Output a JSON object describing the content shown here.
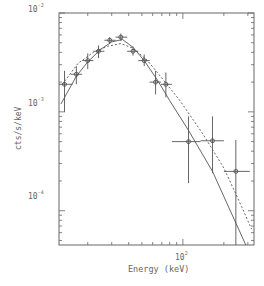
{
  "chart_data": {
    "type": "scatter",
    "title": "",
    "xlabel": "Energy (keV)",
    "ylabel": "cts/s/keV",
    "xscale": "log",
    "yscale": "log",
    "xlim": [
      12.3,
      333
    ],
    "ylim": [
      4.5e-05,
      0.01
    ],
    "x_tick_labels": [
      {
        "value": 100,
        "label": "10",
        "exp": "2"
      }
    ],
    "y_tick_labels": [
      {
        "value": 0.01,
        "label": "10",
        "exp": "-2"
      },
      {
        "value": 0.001,
        "label": "10",
        "exp": "-3"
      },
      {
        "value": 0.0001,
        "label": "10",
        "exp": "-4"
      }
    ],
    "grid": false,
    "legend": null,
    "series": [
      {
        "name": "data",
        "style": "crosses with circle markers",
        "points": [
          {
            "x": 13.5,
            "y": 0.0019,
            "xerr": [
              12.3,
              15.5
            ],
            "yerr": [
              0.001,
              0.0026
            ]
          },
          {
            "x": 16.5,
            "y": 0.0024,
            "xerr": [
              15.0,
              18.2
            ],
            "yerr": [
              0.0019,
              0.0029
            ]
          },
          {
            "x": 20.0,
            "y": 0.0033,
            "xerr": [
              18.2,
              22.0
            ],
            "yerr": [
              0.0027,
              0.0039
            ]
          },
          {
            "x": 24.0,
            "y": 0.0041,
            "xerr": [
              22.0,
              26.5
            ],
            "yerr": [
              0.0035,
              0.0047
            ]
          },
          {
            "x": 29.0,
            "y": 0.0053,
            "xerr": [
              26.5,
              32.0
            ],
            "yerr": [
              0.0049,
              0.0057
            ]
          },
          {
            "x": 35.0,
            "y": 0.0057,
            "xerr": [
              32.0,
              39.0
            ],
            "yerr": [
              0.0052,
              0.0062
            ]
          },
          {
            "x": 43.0,
            "y": 0.0041,
            "xerr": [
              39.0,
              47.0
            ],
            "yerr": [
              0.0037,
              0.0046
            ]
          },
          {
            "x": 52.0,
            "y": 0.0033,
            "xerr": [
              47.0,
              57.0
            ],
            "yerr": [
              0.0029,
              0.0038
            ]
          },
          {
            "x": 63.0,
            "y": 0.002,
            "xerr": [
              57.0,
              69.0
            ],
            "yerr": [
              0.0015,
              0.0026
            ]
          },
          {
            "x": 75.0,
            "y": 0.0019,
            "xerr": [
              69.0,
              83.0
            ],
            "yerr": [
              0.0014,
              0.0025
            ]
          },
          {
            "x": 110.0,
            "y": 0.0005,
            "xerr": [
              83.0,
              135.0
            ],
            "yerr": [
              0.00019,
              0.0009
            ]
          },
          {
            "x": 165.0,
            "y": 0.00051,
            "xerr": [
              135.0,
              200.0
            ],
            "yerr": [
              0.00024,
              0.0009
            ]
          },
          {
            "x": 245.0,
            "y": 0.00025,
            "xerr": [
              200.0,
              310.0
            ],
            "yerr": [
              4.5e-05,
              0.00052
            ]
          }
        ]
      },
      {
        "name": "model (solid)",
        "style": "solid",
        "points": [
          {
            "x": 12.7,
            "y": 0.0012
          },
          {
            "x": 16.5,
            "y": 0.0023
          },
          {
            "x": 20,
            "y": 0.0032
          },
          {
            "x": 25,
            "y": 0.0043
          },
          {
            "x": 30,
            "y": 0.0051
          },
          {
            "x": 36,
            "y": 0.0054
          },
          {
            "x": 43,
            "y": 0.0045
          },
          {
            "x": 52,
            "y": 0.0033
          },
          {
            "x": 65,
            "y": 0.0021
          },
          {
            "x": 80,
            "y": 0.0013
          },
          {
            "x": 110,
            "y": 0.00065
          },
          {
            "x": 165,
            "y": 0.00025
          },
          {
            "x": 245,
            "y": 7.5e-05
          },
          {
            "x": 290,
            "y": 4.5e-05
          }
        ]
      },
      {
        "name": "model (dashed)",
        "style": "dashed",
        "points": [
          {
            "x": 13,
            "y": 0.0019
          },
          {
            "x": 17,
            "y": 0.0031
          },
          {
            "x": 22,
            "y": 0.004
          },
          {
            "x": 28,
            "y": 0.0046
          },
          {
            "x": 35,
            "y": 0.0049
          },
          {
            "x": 43,
            "y": 0.0044
          },
          {
            "x": 55,
            "y": 0.0033
          },
          {
            "x": 70,
            "y": 0.0022
          },
          {
            "x": 95,
            "y": 0.0013
          },
          {
            "x": 140,
            "y": 0.0006
          },
          {
            "x": 200,
            "y": 0.00027
          },
          {
            "x": 270,
            "y": 0.00011
          },
          {
            "x": 320,
            "y": 6.5e-05
          }
        ]
      }
    ]
  },
  "labels": {
    "xlabel": "Energy (keV)",
    "ylabel": "cts/s/keV",
    "ytick_1e-2": "10",
    "ytick_1e-2_exp": "-2",
    "ytick_1e-3": "10",
    "ytick_1e-3_exp": "-3",
    "ytick_1e-4": "10",
    "ytick_1e-4_exp": "-4",
    "xtick_1e2": "10",
    "xtick_1e2_exp": "2"
  }
}
